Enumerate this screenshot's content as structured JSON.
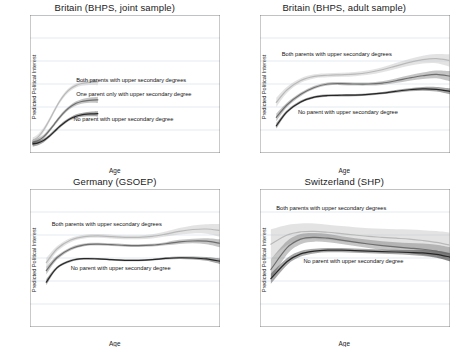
{
  "figure": {
    "panel_count": 4,
    "shared_xlabel": "Age",
    "shared_ylabel": "Predicted Political Interest"
  },
  "chart_data": [
    {
      "type": "line",
      "title": "Britain (BHPS, joint sample)",
      "xlabel": "Age",
      "ylabel": "Predicted Political Interest",
      "xlim": [
        10,
        80
      ],
      "ylim": [
        20,
        80
      ],
      "xticks": [
        10,
        16,
        20,
        40,
        60,
        80
      ],
      "yticks": [
        20,
        30,
        40,
        50,
        60,
        70,
        80
      ],
      "grid": "horizontal",
      "legend": "inline-annotations",
      "annotations": [
        {
          "text": "Both parents with upper secondary degrees",
          "x": 27,
          "y": 51
        },
        {
          "text": "One parent only with upper secondary degree",
          "x": 27,
          "y": 45
        },
        {
          "text": "No parent with upper secondary degree",
          "x": 26,
          "y": 34
        }
      ],
      "x": [
        11,
        13,
        15,
        17,
        19,
        21,
        23,
        25,
        27,
        29,
        31,
        33,
        35
      ],
      "series": [
        {
          "name": "Both parents with upper secondary degrees",
          "color": "#b9b9b9",
          "values": [
            25.2,
            27.0,
            30.0,
            34.0,
            38.5,
            42.6,
            45.8,
            48.0,
            49.4,
            50.2,
            50.6,
            50.8,
            50.9
          ],
          "ci_low": [
            23.6,
            25.7,
            28.9,
            33.0,
            37.6,
            41.7,
            44.9,
            47.1,
            48.5,
            49.2,
            49.5,
            49.6,
            49.5
          ],
          "ci_high": [
            26.8,
            28.3,
            31.1,
            35.0,
            39.4,
            43.5,
            46.7,
            48.9,
            50.3,
            51.2,
            51.7,
            52.0,
            52.3
          ]
        },
        {
          "name": "One parent only with upper secondary degree",
          "color": "#6e6e6e",
          "values": [
            24.6,
            25.4,
            27.0,
            29.6,
            32.6,
            35.6,
            38.2,
            40.2,
            41.6,
            42.4,
            42.8,
            43.0,
            43.1
          ],
          "ci_low": [
            23.2,
            24.3,
            26.1,
            28.8,
            31.8,
            34.8,
            37.4,
            39.4,
            40.7,
            41.4,
            41.7,
            41.8,
            41.7
          ],
          "ci_high": [
            26.0,
            26.5,
            27.9,
            30.4,
            33.4,
            36.4,
            39.0,
            41.0,
            42.5,
            43.4,
            43.9,
            44.2,
            44.5
          ]
        },
        {
          "name": "No parent with upper secondary degree",
          "color": "#262626",
          "values": [
            24.0,
            24.4,
            25.4,
            27.2,
            29.4,
            31.6,
            33.5,
            35.0,
            36.0,
            36.6,
            36.9,
            37.0,
            37.1
          ],
          "ci_low": [
            22.8,
            23.4,
            24.6,
            26.5,
            28.7,
            30.9,
            32.8,
            34.3,
            35.2,
            35.8,
            36.0,
            36.0,
            35.9
          ],
          "ci_high": [
            25.2,
            25.4,
            26.2,
            27.9,
            30.1,
            32.3,
            34.2,
            35.7,
            36.8,
            37.4,
            37.8,
            38.0,
            38.3
          ]
        }
      ]
    },
    {
      "type": "line",
      "title": "Britain (BHPS, adult sample)",
      "xlabel": "Age",
      "ylabel": "Predicted Political Interest",
      "xlim": [
        10,
        80
      ],
      "ylim": [
        20,
        80
      ],
      "xticks": [
        10,
        16,
        20,
        40,
        60,
        80
      ],
      "yticks": [
        20,
        30,
        40,
        50,
        60,
        70,
        80
      ],
      "grid": "horizontal",
      "legend": "inline-annotations",
      "annotations": [
        {
          "text": "Both parents with upper secondary degrees",
          "x": 18,
          "y": 62
        },
        {
          "text": "No parent with upper secondary degree",
          "x": 24,
          "y": 37
        }
      ],
      "x": [
        16,
        20,
        25,
        30,
        35,
        40,
        45,
        50,
        55,
        60,
        65,
        70,
        75,
        80
      ],
      "series": [
        {
          "name": "Both parents with upper secondary degrees",
          "color": "#b9b9b9",
          "values": [
            42.0,
            47.5,
            51.5,
            53.3,
            53.8,
            54.0,
            54.3,
            55.0,
            56.2,
            57.8,
            59.4,
            60.6,
            61.0,
            60.2
          ],
          "ci_low": [
            40.0,
            46.2,
            50.5,
            52.4,
            52.9,
            53.1,
            53.4,
            54.0,
            55.1,
            56.5,
            57.9,
            58.9,
            59.0,
            57.5
          ],
          "ci_high": [
            44.0,
            48.8,
            52.5,
            54.2,
            54.7,
            54.9,
            55.2,
            56.0,
            57.3,
            59.1,
            60.9,
            62.3,
            63.0,
            62.9
          ]
        },
        {
          "name": "One parent only with upper secondary degree",
          "color": "#6e6e6e",
          "values": [
            35.5,
            41.0,
            45.5,
            48.5,
            50.0,
            50.2,
            50.0,
            50.0,
            50.4,
            51.4,
            52.6,
            53.6,
            54.2,
            53.4
          ],
          "ci_low": [
            33.8,
            40.0,
            44.7,
            47.8,
            49.3,
            49.5,
            49.3,
            49.3,
            49.6,
            50.4,
            51.4,
            52.2,
            52.5,
            51.2
          ],
          "ci_high": [
            37.2,
            42.0,
            46.3,
            49.2,
            50.7,
            50.9,
            50.7,
            50.7,
            51.2,
            52.4,
            53.8,
            55.0,
            55.9,
            55.6
          ]
        },
        {
          "name": "No parent with upper secondary degree",
          "color": "#262626",
          "values": [
            31.8,
            38.0,
            42.2,
            44.3,
            45.0,
            45.1,
            45.2,
            45.5,
            46.0,
            46.8,
            47.5,
            47.9,
            47.7,
            46.8
          ],
          "ci_low": [
            30.6,
            37.3,
            41.6,
            43.8,
            44.5,
            44.6,
            44.7,
            45.0,
            45.5,
            46.2,
            46.8,
            47.1,
            46.7,
            45.5
          ],
          "ci_high": [
            33.0,
            38.7,
            42.8,
            44.8,
            45.5,
            45.6,
            45.7,
            46.0,
            46.5,
            47.4,
            48.2,
            48.7,
            48.7,
            48.1
          ]
        }
      ]
    },
    {
      "type": "line",
      "title": "Germany (GSOEP)",
      "xlabel": "Age",
      "ylabel": "Predicted Political Interest",
      "xlim": [
        10,
        80
      ],
      "ylim": [
        20,
        80
      ],
      "xticks": [
        10,
        16,
        20,
        40,
        60,
        80
      ],
      "yticks": [
        20,
        30,
        40,
        50,
        60,
        70,
        80
      ],
      "grid": "horizontal",
      "legend": "inline-annotations",
      "annotations": [
        {
          "text": "Both parents with upper secondary degrees",
          "x": 18,
          "y": 64
        },
        {
          "text": "No parent with upper secondary degree",
          "x": 25,
          "y": 45
        }
      ],
      "x": [
        16,
        20,
        25,
        30,
        35,
        40,
        45,
        50,
        55,
        60,
        65,
        70,
        75,
        80
      ],
      "series": [
        {
          "name": "Both parents with upper secondary degrees",
          "color": "#b9b9b9",
          "values": [
            48.0,
            54.0,
            57.8,
            59.3,
            59.6,
            59.3,
            59.0,
            59.0,
            59.4,
            60.4,
            61.6,
            62.4,
            62.6,
            62.0
          ],
          "ci_low": [
            46.0,
            52.8,
            56.9,
            58.5,
            58.8,
            58.5,
            58.2,
            58.2,
            58.5,
            59.3,
            60.2,
            60.7,
            60.5,
            59.2
          ],
          "ci_high": [
            50.0,
            55.2,
            58.7,
            60.1,
            60.4,
            60.1,
            59.8,
            59.8,
            60.3,
            61.5,
            63.0,
            64.1,
            64.7,
            64.8
          ]
        },
        {
          "name": "One parent only with upper secondary degree",
          "color": "#6e6e6e",
          "values": [
            44.5,
            50.2,
            54.0,
            55.7,
            56.0,
            55.8,
            55.5,
            55.4,
            55.6,
            56.2,
            57.0,
            57.4,
            57.3,
            56.4
          ],
          "ci_low": [
            42.8,
            49.3,
            53.3,
            55.1,
            55.4,
            55.2,
            54.9,
            54.8,
            55.0,
            55.5,
            56.1,
            56.4,
            56.0,
            54.7
          ],
          "ci_high": [
            46.2,
            51.1,
            54.7,
            56.3,
            56.6,
            56.4,
            56.1,
            56.0,
            56.2,
            56.9,
            57.9,
            58.4,
            58.6,
            58.1
          ]
        },
        {
          "name": "No parent with upper secondary degree",
          "color": "#262626",
          "values": [
            39.5,
            45.8,
            48.8,
            49.7,
            49.6,
            49.3,
            49.0,
            49.0,
            49.3,
            49.8,
            50.1,
            50.0,
            49.6,
            48.6
          ],
          "ci_low": [
            38.2,
            45.2,
            48.3,
            49.3,
            49.2,
            48.9,
            48.6,
            48.6,
            48.9,
            49.3,
            49.6,
            49.4,
            48.8,
            47.4
          ],
          "ci_high": [
            40.8,
            46.4,
            49.3,
            50.1,
            50.0,
            49.7,
            49.4,
            49.4,
            49.7,
            50.3,
            50.6,
            50.6,
            50.4,
            49.8
          ]
        }
      ]
    },
    {
      "type": "line",
      "title": "Switzerland (SHP)",
      "xlabel": "Age",
      "ylabel": "Predicted Political Interest",
      "xlim": [
        10,
        80
      ],
      "ylim": [
        30,
        90
      ],
      "xticks": [
        10,
        14,
        20,
        40,
        60,
        80
      ],
      "yticks": [
        30,
        40,
        50,
        60,
        70,
        80,
        90
      ],
      "grid": "horizontal",
      "legend": "inline-annotations",
      "annotations": [
        {
          "text": "Both parents with upper secondary degrees",
          "x": 16,
          "y": 81
        },
        {
          "text": "No parent with upper secondary degree",
          "x": 26,
          "y": 58
        }
      ],
      "x": [
        14,
        20,
        25,
        30,
        35,
        40,
        45,
        50,
        55,
        60,
        65,
        70,
        75,
        80
      ],
      "series": [
        {
          "name": "Both parents with upper secondary degrees",
          "color": "#b9b9b9",
          "values": [
            66.0,
            70.0,
            71.4,
            71.6,
            71.2,
            70.6,
            70.0,
            69.4,
            69.0,
            68.6,
            68.2,
            67.6,
            66.8,
            65.6
          ],
          "ci_low": [
            59.5,
            65.6,
            67.8,
            68.2,
            67.9,
            67.3,
            66.6,
            65.9,
            65.3,
            64.7,
            64.0,
            63.1,
            61.9,
            60.2
          ],
          "ci_high": [
            72.5,
            74.4,
            75.0,
            75.0,
            74.5,
            73.9,
            73.4,
            72.9,
            72.7,
            72.5,
            72.4,
            72.1,
            71.7,
            71.0
          ]
        },
        {
          "name": "One parent only with upper secondary degree",
          "color": "#6e6e6e",
          "values": [
            55.0,
            64.5,
            68.2,
            69.0,
            68.6,
            67.8,
            66.9,
            66.1,
            65.4,
            64.8,
            64.3,
            63.8,
            63.0,
            61.6
          ],
          "ci_low": [
            50.5,
            61.6,
            66.0,
            67.1,
            66.8,
            66.1,
            65.2,
            64.3,
            63.5,
            62.8,
            62.1,
            61.3,
            60.2,
            58.5
          ],
          "ci_high": [
            59.5,
            67.4,
            70.4,
            70.9,
            70.4,
            69.5,
            68.6,
            67.9,
            67.3,
            66.8,
            66.5,
            66.3,
            65.8,
            64.7
          ]
        },
        {
          "name": "No parent with upper secondary degree",
          "color": "#262626",
          "values": [
            51.0,
            58.5,
            61.8,
            63.0,
            63.4,
            63.4,
            63.2,
            63.0,
            62.8,
            62.6,
            62.4,
            62.2,
            61.6,
            60.4
          ],
          "ci_low": [
            48.8,
            57.0,
            60.6,
            62.0,
            62.5,
            62.5,
            62.3,
            62.1,
            61.9,
            61.6,
            61.3,
            60.9,
            60.1,
            58.6
          ],
          "ci_high": [
            53.2,
            60.0,
            63.0,
            64.0,
            64.3,
            64.3,
            64.1,
            63.9,
            63.7,
            63.6,
            63.5,
            63.5,
            63.1,
            62.2
          ]
        }
      ]
    }
  ]
}
